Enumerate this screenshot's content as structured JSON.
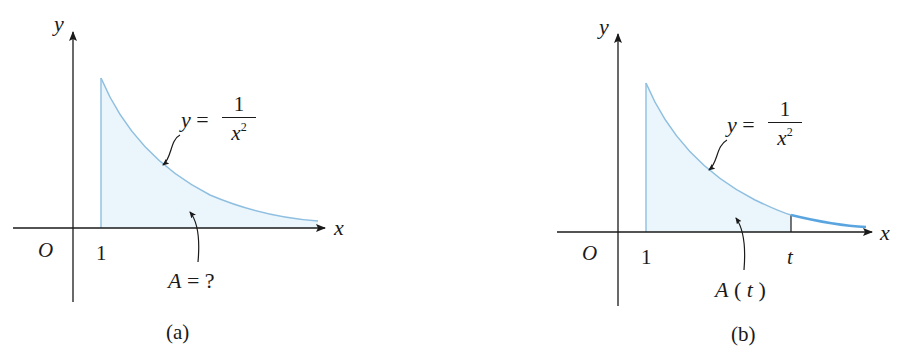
{
  "figures": [
    {
      "id": "a",
      "caption": "(a)",
      "axis_x_label": "x",
      "axis_y_label": "y",
      "origin_label": "O",
      "tick_labels": [
        "1"
      ],
      "curve_label": {
        "lhs": "y",
        "eq": "=",
        "numerator": "1",
        "denominator": "x",
        "exponent": "2"
      },
      "area_label": {
        "text_italic": "A",
        "text_rest": " = ?"
      }
    },
    {
      "id": "b",
      "caption": "(b)",
      "axis_x_label": "x",
      "axis_y_label": "y",
      "origin_label": "O",
      "tick_labels": [
        "1",
        "t"
      ],
      "curve_label": {
        "lhs": "y",
        "eq": "=",
        "numerator": "1",
        "denominator": "x",
        "exponent": "2"
      },
      "area_label": {
        "text_italic": "A",
        "open": "(",
        "var": "t",
        "close": ")"
      }
    }
  ],
  "colors": {
    "curve": "#8fbfe0",
    "curve_tail_b": "#5aa5e0",
    "fill": "#eaf6fc",
    "axis": "#1a1a1a",
    "text": "#1a1a1a"
  }
}
